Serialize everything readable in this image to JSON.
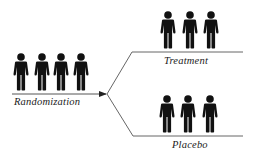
{
  "diagram": {
    "type": "randomization-flow",
    "colors": {
      "figure": "#111111",
      "line": "#555555",
      "text": "#1a1a1a",
      "background": "#ffffff"
    },
    "source_group": {
      "label": "Randomization",
      "person_count": 4,
      "icon": "person-icon"
    },
    "branches": [
      {
        "label": "Treatment",
        "person_count": 3,
        "icon": "person-icon"
      },
      {
        "label": "Placebo",
        "person_count": 3,
        "icon": "person-icon"
      }
    ]
  }
}
